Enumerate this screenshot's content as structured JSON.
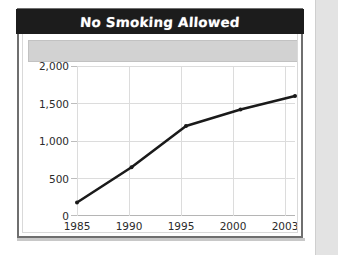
{
  "chart_card": {
    "title": "No Smoking Allowed"
  },
  "chart_data": {
    "type": "line",
    "title": "No Smoking Allowed",
    "xlabel": "",
    "ylabel": "",
    "categories": [
      "1985",
      "1990",
      "1995",
      "2000",
      "2003"
    ],
    "x": [
      1985,
      1990,
      1995,
      2000,
      2003
    ],
    "values": [
      180,
      650,
      1200,
      1420,
      1600
    ],
    "series": [
      {
        "name": "No Smoking Allowed",
        "values": [
          180,
          650,
          1200,
          1420,
          1600
        ]
      }
    ],
    "ylim": [
      0,
      2000
    ],
    "yticks": [
      0,
      500,
      1000,
      1500,
      2000
    ],
    "ytick_labels": [
      "0",
      "500",
      "1,000",
      "1,500",
      "2,000"
    ],
    "xtick_labels": [
      "1985",
      "1990",
      "1995",
      "2000",
      "2003"
    ],
    "grid": true,
    "legend": false,
    "line_color": "#1a1a1a",
    "marker": "dot"
  },
  "style": {
    "banner_bg": "#1c1c1c",
    "banner_text": "#ffffff",
    "grey_bar": "#d2d2d2",
    "plot_bg": "#ffffff",
    "grid_color": "#dcdcdc",
    "frame_color": "#6f6f6f"
  }
}
